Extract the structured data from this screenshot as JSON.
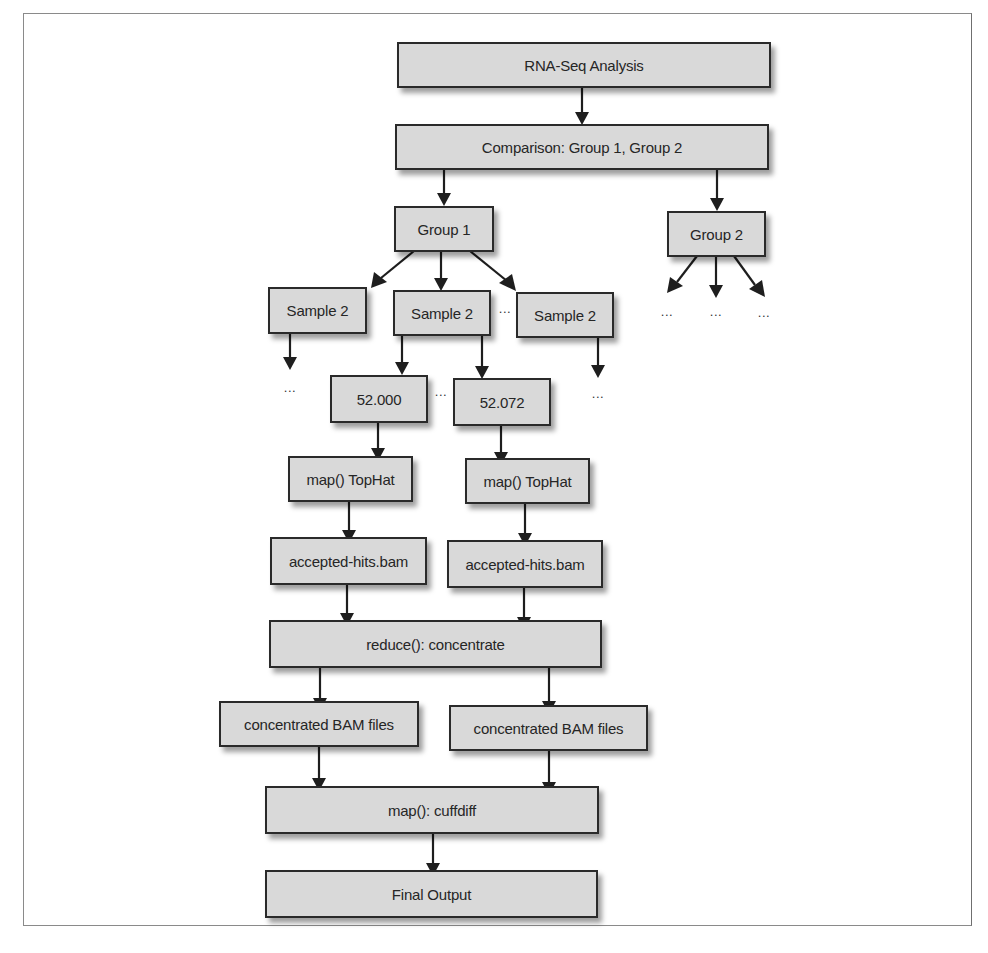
{
  "diagram": {
    "title": "RNA-Seq Analysis",
    "nodes": {
      "root": "RNA-Seq Analysis",
      "comparison": "Comparison: Group 1, Group 2",
      "group1": "Group 1",
      "group2": "Group 2",
      "sample_left": "Sample 2",
      "sample_mid": "Sample 2",
      "sample_right": "Sample 2",
      "file_a": "52.000",
      "file_b": "52.072",
      "map_tophat_a": "map() TopHat",
      "map_tophat_b": "map() TopHat",
      "hits_a": "accepted-hits.bam",
      "hits_b": "accepted-hits.bam",
      "reduce": "reduce(): concentrate",
      "bam_a": "concentrated BAM files",
      "bam_b": "concentrated BAM files",
      "cuffdiff": "map(): cuffdiff",
      "final": "Final Output"
    },
    "ellipsis": "...",
    "colors": {
      "node_fill": "#d9d9d9",
      "node_border": "#2a2a2a",
      "edge": "#1e1e1e",
      "frame": "#8a8a8a"
    },
    "edges": [
      [
        "RNA-Seq Analysis",
        "Comparison: Group 1, Group 2"
      ],
      [
        "Comparison: Group 1, Group 2",
        "Group 1"
      ],
      [
        "Comparison: Group 1, Group 2",
        "Group 2"
      ],
      [
        "Group 1",
        "Sample 2 (left)"
      ],
      [
        "Group 1",
        "Sample 2 (middle)"
      ],
      [
        "Group 1",
        "Sample 2 (right)"
      ],
      [
        "Sample 2 (middle)",
        "52.000"
      ],
      [
        "Sample 2 (middle)",
        "52.072"
      ],
      [
        "52.000",
        "map() TopHat (a)"
      ],
      [
        "52.072",
        "map() TopHat (b)"
      ],
      [
        "map() TopHat (a)",
        "accepted-hits.bam (a)"
      ],
      [
        "map() TopHat (b)",
        "accepted-hits.bam (b)"
      ],
      [
        "accepted-hits.bam (a)",
        "reduce(): concentrate"
      ],
      [
        "accepted-hits.bam (b)",
        "reduce(): concentrate"
      ],
      [
        "reduce(): concentrate",
        "concentrated BAM files (a)"
      ],
      [
        "reduce(): concentrate",
        "concentrated BAM files (b)"
      ],
      [
        "concentrated BAM files (a)",
        "map(): cuffdiff"
      ],
      [
        "concentrated BAM files (b)",
        "map(): cuffdiff"
      ],
      [
        "map(): cuffdiff",
        "Final Output"
      ]
    ]
  }
}
